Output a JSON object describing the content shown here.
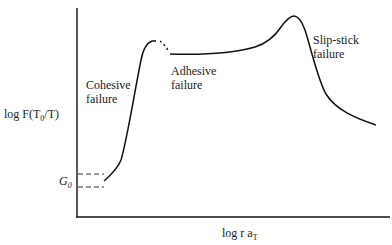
{
  "diagram": {
    "type": "peel-strength master curve",
    "y_axis": {
      "label_main": "log F(T",
      "label_sub": "0",
      "label_tail": "/T)"
    },
    "x_axis": {
      "label_main": "log r a",
      "label_sub": "T"
    },
    "baseline_label": {
      "symbol": "G",
      "subscript": "0"
    },
    "regions": [
      {
        "line1": "Cohesive",
        "line2": "failure"
      },
      {
        "line1": "Adhesive",
        "line2": "failure"
      },
      {
        "line1": "Slip-stick",
        "line2": "failure"
      }
    ],
    "colors": {
      "stroke": "#111111",
      "text": "#222222",
      "background": "#ffffff"
    }
  }
}
